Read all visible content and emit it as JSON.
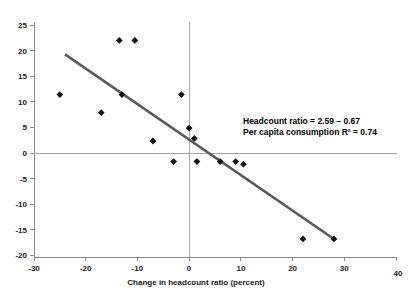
{
  "chart_data": {
    "type": "scatter",
    "title": "",
    "xlabel": "Change in headcount ratio (percent)",
    "ylabel": "",
    "xlim": [
      -30,
      40
    ],
    "ylim": [
      -20,
      25
    ],
    "xticks": [
      -30,
      -20,
      -10,
      0,
      10,
      20,
      30,
      40
    ],
    "xtick_labels": [
      "-30",
      "-20",
      "-10",
      "0",
      "10",
      "20",
      "30",
      "40"
    ],
    "yticks": [
      -20,
      -15,
      -10,
      -5,
      0,
      5,
      10,
      15,
      20,
      25
    ],
    "ytick_labels": [
      "-20",
      "-15",
      "-10",
      "-5",
      "0",
      "5",
      "10",
      "15",
      "20",
      "25"
    ],
    "grid": false,
    "legend": false,
    "zero_lines": {
      "x": 0,
      "y": 0
    },
    "series": [
      {
        "name": "countries",
        "marker": "diamond",
        "color": "#111111",
        "points": [
          {
            "x": -25.0,
            "y": 11.5
          },
          {
            "x": -17.0,
            "y": 8.0
          },
          {
            "x": -13.5,
            "y": 22.0
          },
          {
            "x": -10.5,
            "y": 22.0
          },
          {
            "x": -13.0,
            "y": 11.5
          },
          {
            "x": -7.0,
            "y": 2.5
          },
          {
            "x": -3.0,
            "y": -1.5
          },
          {
            "x": -1.5,
            "y": 11.5
          },
          {
            "x": 0.0,
            "y": 5.0
          },
          {
            "x": 1.0,
            "y": 3.0
          },
          {
            "x": 1.5,
            "y": -1.5
          },
          {
            "x": 6.0,
            "y": -1.5
          },
          {
            "x": 9.0,
            "y": -1.5
          },
          {
            "x": 10.5,
            "y": -2.0
          },
          {
            "x": 22.0,
            "y": -16.5
          },
          {
            "x": 28.0,
            "y": -16.5
          }
        ]
      }
    ],
    "trendline": {
      "name": "regression-line",
      "color": "#5a5a5a",
      "x_start": -24.0,
      "y_start": 19.3,
      "x_end": 28.0,
      "y_end": -16.5,
      "slope": -0.67,
      "intercept": 2.59
    },
    "annotations": [
      {
        "name": "regression-equation",
        "line1": "Headcount ratio = 2.59 – 0.67",
        "line2": "Per capita consumption R² = 0.74"
      }
    ]
  },
  "axes": {
    "x_title": "Change in headcount ratio (percent)"
  }
}
